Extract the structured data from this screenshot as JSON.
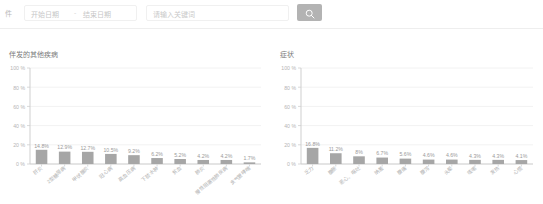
{
  "toolbar": {
    "leading_label": "件",
    "date_range": {
      "start_placeholder": "开始日期",
      "separator": "-",
      "end_placeholder": "结束日期"
    },
    "search": {
      "placeholder": "请输入关键词"
    },
    "search_button": {
      "icon": "search-icon",
      "label": ""
    }
  },
  "chart_data": [
    {
      "id": "comorbidities",
      "type": "bar",
      "title": "伴发的其他疾病",
      "xlabel": "",
      "ylabel": "",
      "ylim": [
        0,
        100
      ],
      "yticks": [
        "0 %",
        "20 %",
        "40 %",
        "60 %",
        "80 %",
        "100 %"
      ],
      "ytick_values": [
        0,
        20,
        40,
        60,
        80,
        100
      ],
      "grid": true,
      "legend": "none",
      "bar_color": "#a6a6a6",
      "categories": [
        "肝炎",
        "2型糖尿病",
        "甲状腺炎",
        "冠心病",
        "高血压病",
        "下肢水肿",
        "贫血",
        "肺炎",
        "慢性阻塞性肺疾病",
        "支气管哮喘"
      ],
      "values": [
        14.8,
        12.9,
        12.7,
        10.5,
        9.2,
        6.2,
        5.2,
        4.2,
        4.2,
        1.7
      ],
      "labels": [
        "14.8%",
        "12.9%",
        "12.7%",
        "10.5%",
        "9.2%",
        "6.2%",
        "5.2%",
        "4.2%",
        "4.2%",
        "1.7%"
      ]
    },
    {
      "id": "symptoms",
      "type": "bar",
      "title": "症状",
      "xlabel": "",
      "ylabel": "",
      "ylim": [
        0,
        100
      ],
      "yticks": [
        "0 %",
        "20 %",
        "40 %",
        "60 %",
        "80 %",
        "100 %"
      ],
      "ytick_values": [
        0,
        20,
        40,
        60,
        80,
        100
      ],
      "grid": true,
      "legend": "none",
      "bar_color": "#a6a6a6",
      "categories": [
        "乏力",
        "腹胀",
        "恶心、呕吐",
        "纳差",
        "腹痛",
        "腹泻",
        "头晕",
        "咳嗽",
        "发热",
        "心慌"
      ],
      "values": [
        16.8,
        11.2,
        8.0,
        6.7,
        5.6,
        4.6,
        4.6,
        4.3,
        4.3,
        4.1
      ],
      "labels": [
        "16.8%",
        "11.2%",
        "8%",
        "6.7%",
        "5.6%",
        "4.6%",
        "4.6%",
        "4.3%",
        "4.3%",
        "4.1%"
      ]
    }
  ]
}
